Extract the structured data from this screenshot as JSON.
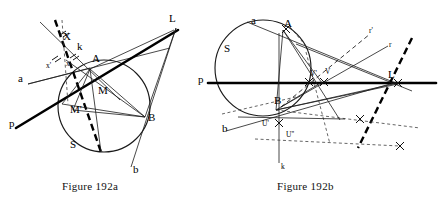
{
  "document": {
    "type": "geometry-figure-plate",
    "background_color": "#ffffff",
    "ink_color": "#111111"
  },
  "figures": [
    {
      "id": "figure-192a",
      "caption": "Figure 192a",
      "description": "Circle S with points A and B on it, external point L, secant line p, line a, line b, line k, and construction points X, M, M'.",
      "labels": [
        {
          "name": "label-a",
          "text": "a",
          "x": 18,
          "y": 82
        },
        {
          "name": "label-p",
          "text": "p",
          "x": 9,
          "y": 127
        },
        {
          "name": "label-X",
          "text": "X",
          "x": 63,
          "y": 40
        },
        {
          "name": "label-k",
          "text": "k",
          "x": 77,
          "y": 50
        },
        {
          "name": "label-A",
          "text": "A",
          "x": 92,
          "y": 62
        },
        {
          "name": "label-L",
          "text": "L",
          "x": 169,
          "y": 22
        },
        {
          "name": "label-M",
          "text": "M",
          "x": 98,
          "y": 94
        },
        {
          "name": "label-Mprime",
          "text": "M'",
          "x": 70,
          "y": 113
        },
        {
          "name": "label-B",
          "text": "B",
          "x": 148,
          "y": 121
        },
        {
          "name": "label-S",
          "text": "S",
          "x": 70,
          "y": 148
        },
        {
          "name": "label-b",
          "text": "b",
          "x": 133,
          "y": 173
        },
        {
          "name": "label-x-prime",
          "text": "x'",
          "x": 50,
          "y": 66
        },
        {
          "name": "label-x",
          "text": "x",
          "x": 69,
          "y": 64
        }
      ]
    },
    {
      "id": "figure-192b",
      "caption": "Figure 192b",
      "description": "Circle S tangent to line p, with points A, B, L on line p, lines a, b, k, r, r' and construction points V, V', U', U''.",
      "labels": [
        {
          "name": "label-S",
          "text": "S",
          "x": 224,
          "y": 52
        },
        {
          "name": "label-a",
          "text": "a",
          "x": 251,
          "y": 24
        },
        {
          "name": "label-A",
          "text": "A",
          "x": 284,
          "y": 27
        },
        {
          "name": "label-rprime",
          "text": "r'",
          "x": 369,
          "y": 33
        },
        {
          "name": "label-r",
          "text": "r",
          "x": 389,
          "y": 47
        },
        {
          "name": "label-p",
          "text": "p",
          "x": 198,
          "y": 83
        },
        {
          "name": "label-Vprime",
          "text": "V'",
          "x": 314,
          "y": 76
        },
        {
          "name": "label-V",
          "text": "V",
          "x": 327,
          "y": 74
        },
        {
          "name": "label-L",
          "text": "L",
          "x": 388,
          "y": 78
        },
        {
          "name": "label-B",
          "text": "B",
          "x": 274,
          "y": 104
        },
        {
          "name": "label-b",
          "text": "b",
          "x": 222,
          "y": 132
        },
        {
          "name": "label-Uprime",
          "text": "U'",
          "x": 264,
          "y": 124
        },
        {
          "name": "label-Udprime",
          "text": "U''",
          "x": 288,
          "y": 135
        },
        {
          "name": "label-k",
          "text": "k",
          "x": 282,
          "y": 167
        }
      ]
    }
  ]
}
